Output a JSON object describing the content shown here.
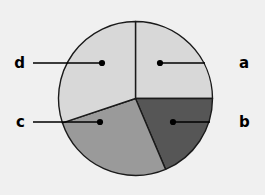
{
  "chart_data": {
    "type": "pie",
    "title": "",
    "subtitle": "",
    "xlabel": "",
    "ylabel": "",
    "legend_position": "callout-labels",
    "grid": false,
    "center": {
      "x": 135.5,
      "y": 98.5
    },
    "radius": 77,
    "start_angle_deg": 0,
    "direction": "clockwise",
    "categories": [
      "a",
      "b",
      "c",
      "d"
    ],
    "values": [
      25.0,
      18.6,
      26.2,
      30.2
    ],
    "units": "percent",
    "slices": [
      {
        "label": "a",
        "value": 25.0,
        "start_angle_deg": 0,
        "end_angle_deg": 90,
        "color": "#d8d8d8",
        "label_side": "right",
        "label_x": 239,
        "label_y": 63,
        "leader_x1": 205,
        "leader_x2": 160,
        "leader_y": 63,
        "dot_x": 160,
        "dot_y": 63
      },
      {
        "label": "b",
        "value": 18.6,
        "start_angle_deg": 90,
        "end_angle_deg": 157,
        "color": "#565656",
        "label_side": "right",
        "label_x": 239,
        "label_y": 122,
        "leader_x1": 210,
        "leader_x2": 173,
        "leader_y": 122,
        "dot_x": 173,
        "dot_y": 122
      },
      {
        "label": "c",
        "value": 26.2,
        "start_angle_deg": 157,
        "end_angle_deg": 251.5,
        "color": "#9a9a9a",
        "label_side": "left",
        "label_x": 25,
        "label_y": 122,
        "leader_x1": 33,
        "leader_x2": 100,
        "leader_y": 122,
        "dot_x": 100,
        "dot_y": 122
      },
      {
        "label": "d",
        "value": 30.2,
        "start_angle_deg": 251.5,
        "end_angle_deg": 360,
        "color": "#d8d8d8",
        "label_side": "left",
        "label_x": 25,
        "label_y": 63,
        "leader_x1": 33,
        "leader_x2": 102,
        "leader_y": 63,
        "dot_x": 102,
        "dot_y": 63
      }
    ],
    "colors": {
      "background": "#f0f0f0",
      "outline": "#1a1a1a",
      "label_text": "#000000",
      "leader": "#000000"
    }
  }
}
